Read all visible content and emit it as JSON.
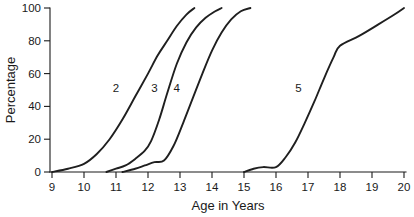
{
  "chart_data": {
    "type": "line",
    "title": "",
    "subtitle": "",
    "xlabel": "Age in Years",
    "ylabel": "Percentage",
    "xlim": [
      9,
      20
    ],
    "ylim": [
      0,
      100
    ],
    "grid": false,
    "legend_position": "inline-curve-labels",
    "xticks": [
      9,
      10,
      11,
      12,
      13,
      14,
      15,
      16,
      17,
      18,
      19,
      20
    ],
    "xtick_labels": [
      "9",
      "10",
      "11",
      "12",
      "13",
      "14",
      "15",
      "16",
      "17",
      "18",
      "19",
      "20"
    ],
    "yticks": [
      0,
      20,
      40,
      60,
      80,
      100
    ],
    "ytick_labels": [
      "0",
      "20",
      "40",
      "60",
      "80",
      "100"
    ],
    "line_color": "#1f1f1f",
    "series": [
      {
        "name": "2",
        "label": "2",
        "label_x": 11.0,
        "label_y": 51,
        "x": [
          9.0,
          9.5,
          10.0,
          10.4,
          10.8,
          11.2,
          11.6,
          12.0,
          12.3,
          12.6,
          12.9,
          13.2,
          13.45
        ],
        "y": [
          0,
          2,
          5,
          11,
          20,
          32,
          46,
          60,
          71,
          80,
          89,
          96,
          100
        ]
      },
      {
        "name": "3",
        "label": "3",
        "label_x": 12.2,
        "label_y": 51,
        "x": [
          10.7,
          11.0,
          11.3,
          11.6,
          11.9,
          12.1,
          12.35,
          12.6,
          12.9,
          13.2,
          13.5,
          13.8,
          14.1,
          14.3
        ],
        "y": [
          0,
          2,
          4,
          8,
          13,
          19,
          32,
          48,
          66,
          79,
          88,
          94,
          98,
          100
        ]
      },
      {
        "name": "4",
        "label": "4",
        "label_x": 12.9,
        "label_y": 51,
        "x": [
          11.2,
          11.6,
          11.9,
          12.2,
          12.5,
          12.8,
          13.1,
          13.4,
          13.7,
          14.0,
          14.3,
          14.6,
          14.9,
          15.2
        ],
        "y": [
          0,
          2,
          4,
          6,
          7,
          16,
          30,
          45,
          60,
          74,
          85,
          93,
          98,
          100
        ]
      },
      {
        "name": "5",
        "label": "5",
        "label_x": 16.7,
        "label_y": 51,
        "x": [
          15.0,
          15.3,
          15.6,
          16.0,
          16.3,
          16.6,
          16.9,
          17.2,
          17.5,
          17.8,
          18.0,
          18.6,
          19.2,
          19.7,
          20.0
        ],
        "y": [
          0,
          2,
          3,
          3,
          9,
          18,
          30,
          43,
          57,
          70,
          77,
          83,
          90,
          96,
          100
        ]
      }
    ]
  }
}
